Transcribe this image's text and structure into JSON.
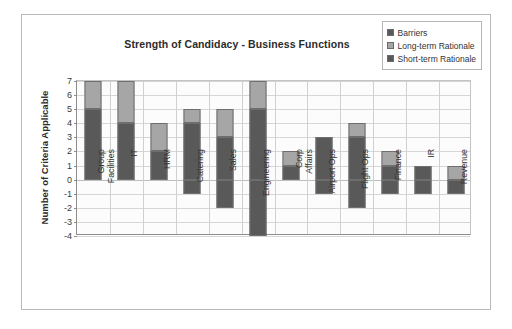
{
  "chart_data": {
    "type": "bar",
    "subtype": "stacked-with-negative",
    "title": "Strength of Candidacy - Business Functions",
    "xlabel": "",
    "ylabel": "Number of Criteria Applicable",
    "ylim": [
      -4,
      7
    ],
    "yticks": [
      7,
      6,
      5,
      4,
      3,
      2,
      1,
      0,
      -1,
      -2,
      -3,
      -4
    ],
    "grid": true,
    "legend_position": "top-right",
    "categories": [
      "Group\nFacilities",
      "IT",
      "HRM",
      "Catering",
      "Sales",
      "Engineering",
      "Corp\nAffairs",
      "Airport Ops",
      "Flight Ops",
      "Finance",
      "IR",
      "Revenue"
    ],
    "series": [
      {
        "name": "Short-term Rationale",
        "color": "#595959",
        "values": [
          5,
          4,
          2,
          4,
          3,
          5,
          1,
          3,
          3,
          1,
          1,
          0
        ]
      },
      {
        "name": "Long-term Rationale",
        "color": "#a6a6a6",
        "values": [
          2,
          3,
          2,
          1,
          2,
          2,
          1,
          0,
          1,
          1,
          0,
          1
        ]
      },
      {
        "name": "Barriers",
        "color": "#595959",
        "values": [
          0,
          0,
          0,
          -1,
          -2,
          -4,
          0,
          -1,
          -2,
          -1,
          -1,
          -1
        ]
      }
    ],
    "bars": [
      {
        "category": "Group\nFacilities",
        "short_term": 5,
        "long_term": 2,
        "barriers": 0,
        "total_positive": 7
      },
      {
        "category": "IT",
        "short_term": 4,
        "long_term": 3,
        "barriers": 0,
        "total_positive": 7
      },
      {
        "category": "HRM",
        "short_term": 2,
        "long_term": 2,
        "barriers": 0,
        "total_positive": 4
      },
      {
        "category": "Catering",
        "short_term": 4,
        "long_term": 1,
        "barriers": -1,
        "total_positive": 5
      },
      {
        "category": "Sales",
        "short_term": 3,
        "long_term": 2,
        "barriers": -2,
        "total_positive": 5
      },
      {
        "category": "Engineering",
        "short_term": 5,
        "long_term": 2,
        "barriers": -4,
        "total_positive": 7
      },
      {
        "category": "Corp\nAffairs",
        "short_term": 1,
        "long_term": 1,
        "barriers": 0,
        "total_positive": 2
      },
      {
        "category": "Airport Ops",
        "short_term": 3,
        "long_term": 0,
        "barriers": -1,
        "total_positive": 3
      },
      {
        "category": "Flight Ops",
        "short_term": 3,
        "long_term": 1,
        "barriers": -2,
        "total_positive": 4
      },
      {
        "category": "Finance",
        "short_term": 1,
        "long_term": 1,
        "barriers": -1,
        "total_positive": 2
      },
      {
        "category": "IR",
        "short_term": 1,
        "long_term": 0,
        "barriers": -1,
        "total_positive": 1
      },
      {
        "category": "Revenue",
        "short_term": 0,
        "long_term": 1,
        "barriers": -1,
        "total_positive": 1
      }
    ]
  },
  "legend": {
    "items": [
      {
        "label": "Barriers",
        "color": "#595959"
      },
      {
        "label": "Long-term Rationale",
        "color": "#a6a6a6"
      },
      {
        "label": "Short-term Rationale",
        "color": "#595959"
      }
    ]
  },
  "colors": {
    "dark_gray": "#595959",
    "light_gray": "#a6a6a6",
    "border": "#6e6e6e",
    "grid": "#d6d6d6",
    "axis": "#8d8d8d",
    "text": "#333333"
  }
}
